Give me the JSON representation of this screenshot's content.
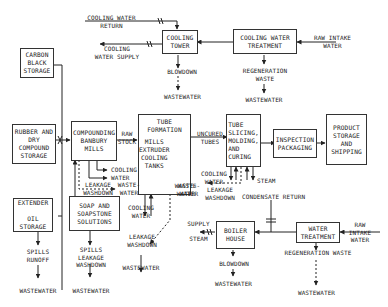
{
  "diagram": {
    "type": "process-flow",
    "boxes": {
      "carbon_black_storage": "CARBON\nBLACK\nSTORAGE",
      "rubber_dry_compound_storage": "RUBBER AND\nDRY\nCOMPOUND\nSTORAGE",
      "extender_oil_storage": "EXTENDER\n\nOIL\nSTORAGE",
      "compounding_banbury_mills": "COMPOUNDING\nBANBURY\nMILLS",
      "soap_soapstone_solutions": "SOAP AND\nSOAPSTONE\nSOLUTIONS",
      "tube_formation_title": "TUBE FORMATION",
      "tube_formation_body": "MILLS\nEXTRUDER\nCOOLING\nTANKS",
      "tube_slicing": "TUBE\nSLICING,\nMOLDING,\nAND\nCURING",
      "inspection_packaging": "INSPECTION\nPACKAGING",
      "product_storage_shipping": "PRODUCT\nSTORAGE\nAND\nSHIPPING",
      "cooling_tower": "COOLING\nTOWER",
      "cooling_water_treatment": "COOLING WATER\nTREATMENT",
      "boiler_house": "BOILER\nHOUSE",
      "water_treatment": "WATER\nTREATMENT"
    },
    "labels": {
      "cooling_water_return": "COOLING WATER\nRETURN",
      "cooling_water_supply": "COOLING\nWATER SUPPLY",
      "raw_intake_water_top": "RAW INTAKE\nWATER",
      "blowdown_top": "BLOWDOWN",
      "wastewater_top_left": "WASTEWATER",
      "regeneration_waste_top": "REGENERATION\nWASTE",
      "wastewater_top_right": "WASTEWATER",
      "raw_stock": "RAW\nSTOCK",
      "uncured_tubes": "UNCURED\nTUBES",
      "cooling_water_banbury": "COOLING\nWATER",
      "leakage_washdown_banbury": "LEAKAGE\nWASHDOWN",
      "waste_water_banbury": "WASTE-\nWATER",
      "waste_water_tube_formation": "WASTE-\nWATER",
      "cooling_water_tube_formation": "COOLING\nWATER",
      "leakage_washdown_mid": "LEAKAGE\nWASHDOWN",
      "wastewater_mid": "WASTEWATER",
      "cooling_water_slicing": "COOLING\nWATER",
      "steam_slicing": "STEAM",
      "waste_water_slicing": "WASTE-\nWATER",
      "leakage_washdown_slicing": "LEAKAGE\nWASHDOWN",
      "condensate_return": "CONDENSATE RETURN",
      "supply_steam": "SUPPLY\n\nSTEAM",
      "blowdown_boiler": "BLOWDOWN",
      "wastewater_boiler": "WASTEWATER",
      "regeneration_waste_bottom": "REGENERATION WASTE",
      "wastewater_water_treatment": "WASTEWATER",
      "raw_intake_water_bottom": "RAW\nINTAKE\nWATER",
      "spills_runoff": "SPILLS\nRUNOFF",
      "wastewater_extender": "WASTEWATER",
      "spills_leakage_washdown": "SPILLS\nLEAKAGE\nWASHDOWN",
      "wastewater_soap": "WASTEWATER"
    }
  }
}
